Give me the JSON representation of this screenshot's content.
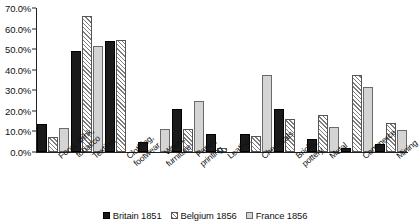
{
  "chart_data": {
    "type": "bar",
    "title": "",
    "xlabel": "",
    "ylabel": "",
    "ylim": [
      0,
      70
    ],
    "ytick_labels": [
      "0.0%",
      "10.0%",
      "20.0%",
      "30.0%",
      "40.0%",
      "50.0%",
      "60.0%",
      "70.0%"
    ],
    "ytick_values": [
      0,
      10,
      20,
      30,
      40,
      50,
      60,
      70
    ],
    "grid": false,
    "legend_position": "bottom",
    "categories": [
      "Food, drink, tobacco",
      "Textiles",
      "Clothing, footwear",
      "Wood, furniture",
      "Paper, printing",
      "Leather",
      "Chemicals",
      "Bricks, pottery",
      "Metal",
      "Commerce",
      "Mining"
    ],
    "category_lines": [
      [
        "Food, drink,",
        "tobacco"
      ],
      [
        "Textiles"
      ],
      [
        "Clothing,",
        "footwear"
      ],
      [
        "Wood,",
        "furniture"
      ],
      [
        "Paper,",
        "printing"
      ],
      [
        "Leather"
      ],
      [
        "Chemicals"
      ],
      [
        "Bricks,",
        "pottery"
      ],
      [
        "Metal"
      ],
      [
        "Commerce"
      ],
      [
        "Mining"
      ]
    ],
    "series": [
      {
        "name": "Britain 1851",
        "color": "#1a1a1a",
        "pattern": "solid-black",
        "values": [
          13.5,
          49.0,
          54.0,
          5.0,
          21.0,
          9.0,
          9.0,
          21.0,
          6.5,
          2.0,
          4.0
        ]
      },
      {
        "name": "Belgium 1856",
        "color": "#ffffff",
        "pattern": "diagonal-hatch",
        "values": [
          7.5,
          66.0,
          54.5,
          0.0,
          11.0,
          2.0,
          8.0,
          16.0,
          18.0,
          37.5,
          14.0
        ]
      },
      {
        "name": "France 1856",
        "color": "#d4d4d4",
        "pattern": "light-gray",
        "values": [
          11.5,
          51.5,
          0.0,
          11.0,
          25.0,
          0.0,
          37.5,
          0.0,
          12.0,
          31.5,
          10.5
        ]
      }
    ]
  },
  "legend": {
    "items": [
      {
        "label": "Britain 1851"
      },
      {
        "label": "Belgium 1856"
      },
      {
        "label": "France 1856"
      }
    ]
  }
}
